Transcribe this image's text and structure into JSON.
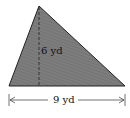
{
  "figure": {
    "shape": "triangle",
    "fill_color": "#7a7a7a",
    "stroke_color": "#222222",
    "height_label": "6 yd",
    "base_label": "9 yd"
  }
}
